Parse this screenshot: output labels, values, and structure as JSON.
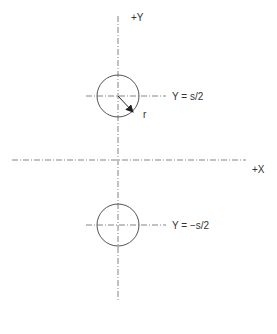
{
  "diagram": {
    "axes": {
      "y_label": "+Y",
      "x_label": "+X"
    },
    "upper_circle": {
      "label": "Y = s/2",
      "radius_label": "r"
    },
    "lower_circle": {
      "label": "Y = −s/2"
    }
  }
}
